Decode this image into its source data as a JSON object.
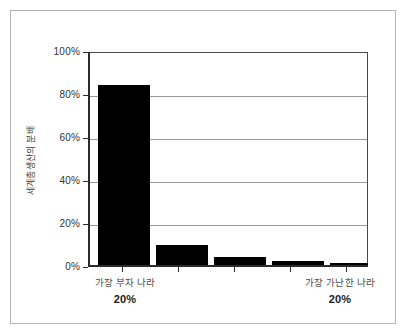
{
  "chart_data": {
    "type": "bar",
    "title": "",
    "subtitle": "",
    "xlabel": "",
    "ylabel": "세계총생산의 분배",
    "categories": [
      "가장 부자 나라 20%",
      "",
      "",
      "",
      "가장 가난한 나라 20%"
    ],
    "values": [
      85,
      9.5,
      4,
      2,
      1
    ],
    "value_unit": "%",
    "ylim": [
      0,
      100
    ],
    "ytick_values": [
      0,
      20,
      40,
      60,
      80,
      100
    ],
    "ytick_labels": [
      "0%",
      "20%",
      "40%",
      "60%",
      "80%",
      "100%"
    ],
    "grid": true,
    "grid_axis": "y",
    "legend": false,
    "legend_position": "none",
    "bar_color": "#000000",
    "series": [
      {
        "name": "세계총생산의 분배",
        "values": [
          85,
          9.5,
          4,
          2,
          1
        ]
      }
    ]
  },
  "axis": {
    "y_title": "세계총생산의 분배",
    "ticks": [
      {
        "label": "100%",
        "value": 100
      },
      {
        "label": "80%",
        "value": 80
      },
      {
        "label": "60%",
        "value": 60
      },
      {
        "label": "40%",
        "value": 40
      },
      {
        "label": "20%",
        "value": 20
      },
      {
        "label": "0%",
        "value": 0
      }
    ]
  },
  "category_labels": [
    {
      "name": "가장 부자 나라",
      "pct": "20%"
    },
    {
      "name": "가장 가난한 나라",
      "pct": "20%"
    }
  ],
  "colors": {
    "bar": "#000000",
    "axis": "#2b2b2b",
    "grid": "#9a9a9a",
    "frame": "#b4b4b4",
    "background": "#ffffff",
    "tick_text": "#333333",
    "label_text": "#4a4a4a"
  }
}
